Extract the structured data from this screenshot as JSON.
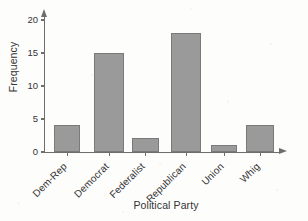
{
  "chart_data": {
    "type": "bar",
    "title": "",
    "xlabel": "Political Party",
    "ylabel": "Frequency",
    "categories": [
      "Dem-Rep",
      "Democrat",
      "Federalist",
      "Republican",
      "Union",
      "Whig"
    ],
    "values": [
      4,
      15,
      2,
      18,
      1,
      4
    ],
    "ylim": [
      0,
      20
    ],
    "yticks": [
      0,
      5,
      10,
      15,
      20
    ],
    "ytick_labels": [
      "0",
      "5",
      "10",
      "15",
      "20"
    ],
    "grid": false,
    "legend": "none",
    "bar_color": "#9a9a9a",
    "bar_border_color": "#7a7a7a",
    "axis_color": "#6e6e6e",
    "text_color": "#333333",
    "xtick_label_rotation": -45
  }
}
